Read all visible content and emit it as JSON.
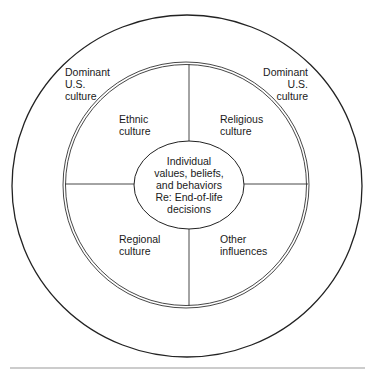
{
  "diagram": {
    "type": "concentric-influence-diagram",
    "outer_ring": {
      "label_left": "Dominant\nU.S.\nculture",
      "label_right": "Dominant\nU.S.\nculture"
    },
    "quadrants": {
      "top_left": "Ethnic\nculture",
      "top_right": "Religious\nculture",
      "bottom_left": "Regional\nculture",
      "bottom_right": "Other\ninfluences"
    },
    "center": {
      "label": "Individual\nvalues, beliefs,\nand behaviors\nRe: End-of-life\ndecisions"
    },
    "colors": {
      "stroke": "#222222",
      "background": "#ffffff",
      "text": "#1a1a1a"
    }
  }
}
